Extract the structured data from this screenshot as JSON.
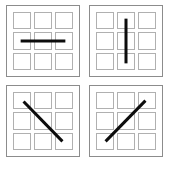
{
  "figure": {
    "background_color": "#ffffff",
    "panel_border_color": "#8c8c8c",
    "cell_border_color": "#b0b0b0",
    "bar_color": "#0d0d0d",
    "caption": ""
  },
  "panels": [
    {
      "id": "panel-horizontal",
      "position": "top-left",
      "orientation_label": "horizontal",
      "orientation_degrees": 0,
      "grid_rows": 3,
      "grid_cols": 3,
      "bar": {
        "x1": 14,
        "y1": 36,
        "x2": 60,
        "y2": 36
      }
    },
    {
      "id": "panel-vertical",
      "position": "top-right",
      "orientation_label": "vertical",
      "orientation_degrees": 90,
      "grid_rows": 3,
      "grid_cols": 3,
      "bar": {
        "x1": 37,
        "y1": 13,
        "x2": 37,
        "y2": 59
      }
    },
    {
      "id": "panel-diagonal-down",
      "position": "bottom-left",
      "orientation_label": "diagonal down-right",
      "orientation_degrees": 135,
      "grid_rows": 3,
      "grid_cols": 3,
      "bar": {
        "x1": 17,
        "y1": 16,
        "x2": 57,
        "y2": 57
      }
    },
    {
      "id": "panel-diagonal-up",
      "position": "bottom-right",
      "orientation_label": "diagonal up-right",
      "orientation_degrees": 45,
      "grid_rows": 3,
      "grid_cols": 3,
      "bar": {
        "x1": 16,
        "y1": 57,
        "x2": 57,
        "y2": 15
      }
    }
  ],
  "cells": {
    "count_per_panel": 9,
    "labels": [
      "r1c1",
      "r1c2",
      "r1c3",
      "r2c1",
      "r2c2",
      "r2c3",
      "r3c1",
      "r3c2",
      "r3c3"
    ]
  }
}
